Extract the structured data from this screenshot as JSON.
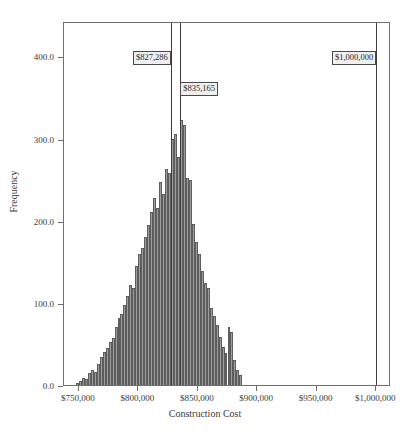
{
  "chart_data": {
    "type": "bar",
    "title": "",
    "subtitle": "",
    "xlabel": "Construction Cost",
    "ylabel": "Frequency",
    "grid": false,
    "legend": null,
    "xlim": [
      737500,
      1012500
    ],
    "ylim": [
      0,
      443
    ],
    "xtick_labels": [
      "$750,000",
      "$800,000",
      "$850,000",
      "$900,000",
      "$950,000",
      "$1,000,000"
    ],
    "xtick_values": [
      750000,
      800000,
      850000,
      900000,
      950000,
      1000000
    ],
    "ytick_labels": [
      "0.0",
      "100.0",
      "200.0",
      "300.0",
      "400.0"
    ],
    "ytick_values": [
      0,
      100,
      200,
      300,
      400
    ],
    "bin_width": 2500,
    "bin_starts": [
      747500,
      750000,
      752500,
      755000,
      757500,
      760000,
      762500,
      765000,
      767500,
      770000,
      772500,
      775000,
      777500,
      780000,
      782500,
      785000,
      787500,
      790000,
      792500,
      795000,
      797500,
      800000,
      802500,
      805000,
      807500,
      810000,
      812500,
      815000,
      817500,
      820000,
      822500,
      825000,
      827500,
      830000,
      832500,
      835000,
      837500,
      840000,
      842500,
      845000,
      847500,
      850000,
      852500,
      855000,
      857500,
      860000,
      862500,
      865000,
      867500,
      870000,
      872500,
      875000,
      877500,
      880000,
      882500,
      885000
    ],
    "values": [
      3,
      5,
      9,
      7,
      15,
      18,
      16,
      25,
      34,
      40,
      45,
      52,
      57,
      70,
      82,
      86,
      97,
      108,
      122,
      118,
      145,
      160,
      167,
      180,
      195,
      210,
      228,
      215,
      247,
      233,
      263,
      258,
      300,
      305,
      278,
      322,
      316,
      252,
      250,
      196,
      174,
      160,
      139,
      124,
      118,
      94,
      84,
      73,
      58,
      46,
      39,
      70,
      64,
      31,
      18,
      12
    ],
    "peak_value": 322,
    "annotations": [
      {
        "label": "$827,286",
        "x": 827286,
        "kind": "vertical-line-with-box",
        "box_y": 400
      },
      {
        "label": "$835,165",
        "x": 835165,
        "kind": "vertical-line-with-box",
        "box_y": 363
      },
      {
        "label": "$1,000,000",
        "x": 1000000,
        "kind": "vertical-line-with-box",
        "box_y": 400
      }
    ]
  }
}
